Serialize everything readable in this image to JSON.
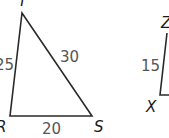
{
  "diagram": {
    "triangles": [
      {
        "name": "RST",
        "vertices": {
          "T": "T",
          "R": "R",
          "S": "S"
        },
        "sides": {
          "TR": "25",
          "TS": "30",
          "RS": "20"
        }
      },
      {
        "name": "XYZ",
        "vertices": {
          "Z": "Z",
          "X": "X"
        },
        "sides": {
          "XZ": "15"
        }
      }
    ],
    "colors": {
      "line": "#2a2a2a",
      "label": "#1a1a1a",
      "length": "#555555"
    }
  }
}
